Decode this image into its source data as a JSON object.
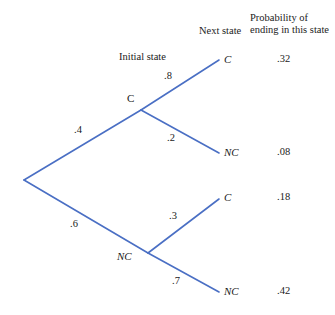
{
  "headers": {
    "next_state": "Next state",
    "probability_line1": "Probability of",
    "probability_line2": "ending in this state"
  },
  "tree": {
    "initial_state_label": "Initial state",
    "root_label": "",
    "nodes": {
      "level1_c": "C",
      "level1_nc": "NC"
    },
    "branch_probabilities": {
      "root_to_c": ".4",
      "root_to_nc": ".6",
      "c_to_c": ".8",
      "c_to_nc": ".2",
      "nc_to_c": ".3",
      "nc_to_nc": ".7"
    },
    "leaves": [
      {
        "state": "C",
        "probability": ".32"
      },
      {
        "state": "NC",
        "probability": ".08"
      },
      {
        "state": "C",
        "probability": ".18"
      },
      {
        "state": "NC",
        "probability": ".42"
      }
    ]
  },
  "style": {
    "line_color": "#4a6fc4",
    "background": "#ffffff",
    "text_color": "#1a1a1a"
  }
}
